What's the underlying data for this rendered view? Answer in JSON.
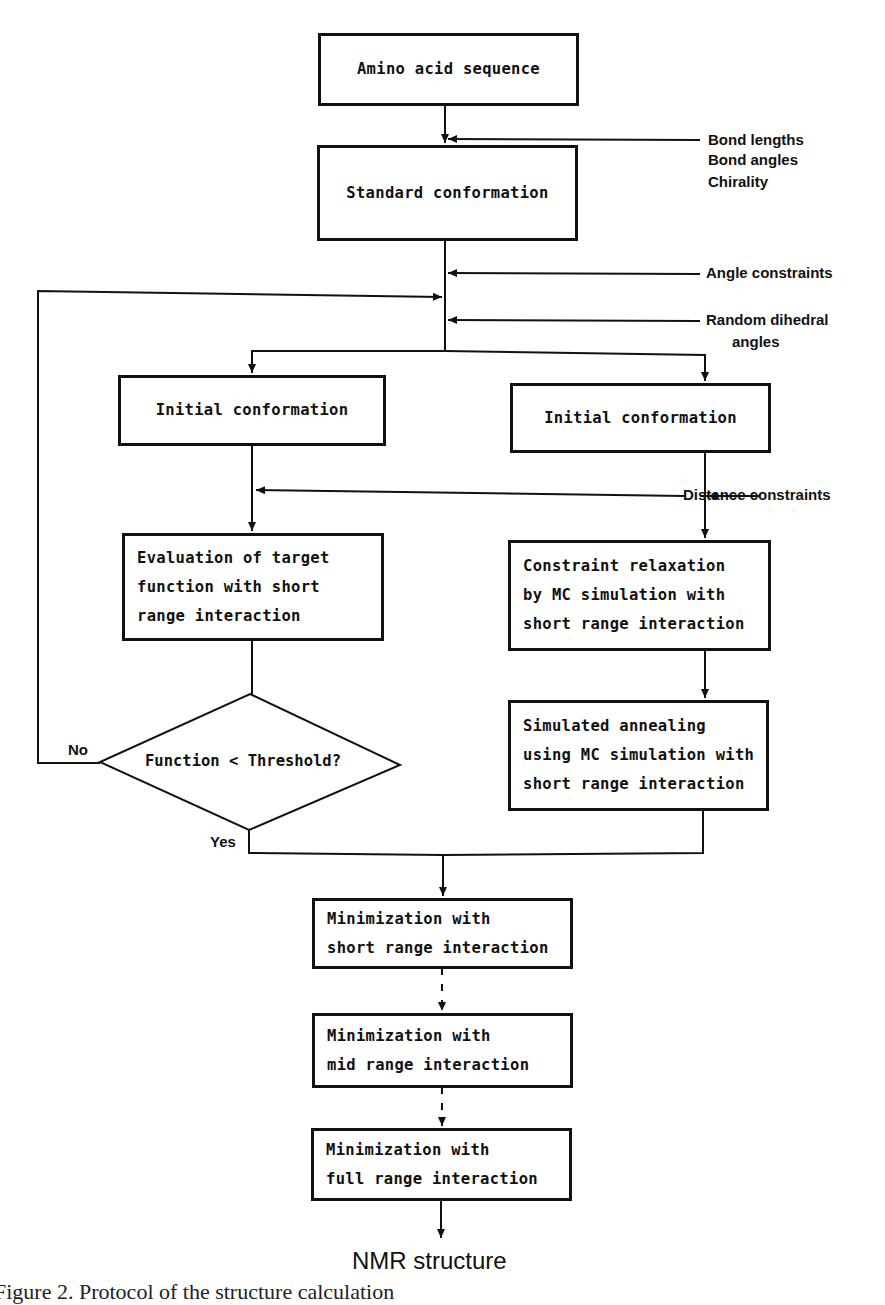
{
  "diagram": {
    "type": "flowchart",
    "nodes": {
      "amino_acid_sequence": {
        "lines": [
          "Amino acid sequence"
        ]
      },
      "standard_conformation": {
        "lines": [
          "Standard conformation"
        ]
      },
      "initial_conformation_left": {
        "lines": [
          "Initial conformation"
        ]
      },
      "initial_conformation_right": {
        "lines": [
          "Initial conformation"
        ]
      },
      "evaluation": {
        "lines": [
          "Evaluation of target",
          "function with short",
          "range interaction"
        ]
      },
      "constraint_relaxation": {
        "lines": [
          "Constraint relaxation",
          "by MC simulation with",
          "short range interaction"
        ]
      },
      "simulated_annealing": {
        "lines": [
          "Simulated annealing",
          "using MC simulation with",
          "short range interaction"
        ]
      },
      "decision": {
        "text": "Function < Threshold?",
        "no_label": "No",
        "yes_label": "Yes"
      },
      "min_short": {
        "lines": [
          "Minimization with",
          "short range interaction"
        ]
      },
      "min_mid": {
        "lines": [
          "Minimization with",
          "mid range interaction"
        ]
      },
      "min_full": {
        "lines": [
          "Minimization with",
          "full range interaction"
        ]
      },
      "output": {
        "text": "NMR structure"
      }
    },
    "inputs": {
      "geometry": [
        "Bond lengths",
        "Bond angles",
        "Chirality"
      ],
      "angle_constraints": "Angle constraints",
      "random_dihedral": [
        "Random dihedral",
        "angles"
      ],
      "distance_constraints": "Distance constraints"
    },
    "caption": "Figure 2. Protocol of the structure calculation"
  }
}
